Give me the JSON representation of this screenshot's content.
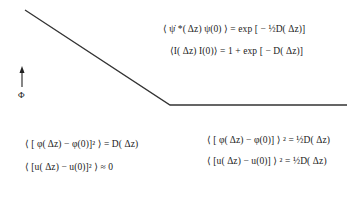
{
  "figure": {
    "axis_label": "Φ",
    "curve": {
      "points": [
        [
          25,
          10
        ],
        [
          170,
          105
        ],
        [
          347,
          105
        ]
      ],
      "color": "#333333"
    },
    "arrow": {
      "x": 22,
      "y_top": 68,
      "y_bottom": 87
    }
  },
  "formulas": {
    "top": [
      "⟨ ψ̇ *( Δz) ψ(0) ⟩ = exp [ − ½D( Δz)]",
      "⟨I( Δz) I(0)⟩ = 1 + exp [ − D( Δz)]"
    ],
    "bottom_left": [
      "⟨ [ φ( Δz) − φ(0)]² ⟩ = D( Δz)",
      "⟨ [u( Δz) − u(0)]² ⟩ ≈ 0"
    ],
    "bottom_right": [
      "⟨ [ φ( Δz) − φ(0)] ⟩ ² = ½D( Δz)",
      "⟨ [u( Δz) − u(0)] ⟩ ² = ½D( Δz)"
    ]
  }
}
